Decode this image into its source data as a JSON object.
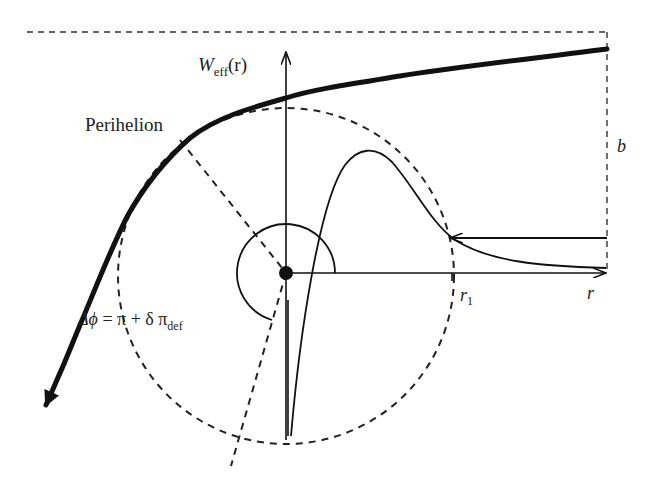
{
  "figure": {
    "labels": {
      "potential_axis": {
        "main": "W",
        "sub": "eff",
        "arg": "(r)"
      },
      "perihelion": "Perihelion",
      "deflection_angle": {
        "lhs": "Δϕ",
        "eq": " = π + δ π",
        "sub": "def"
      },
      "r1": {
        "main": "r",
        "sub": "1"
      },
      "r_axis": "r",
      "impact_parameter": "b"
    },
    "colors": {
      "stroke": "#111111",
      "dashed": "#222222",
      "background": "#ffffff"
    },
    "elements": {
      "trajectory": "thick curve with arrowhead (incoming from right, outgoing down-left)",
      "potential_curve": "thin curve W_eff(r) with a peak then decaying toward r axis",
      "dashed_circle": "circle of radius r1 around central mass",
      "angle_arc": "arc indicating deflection angle",
      "central_mass": "filled dot at origin"
    }
  }
}
